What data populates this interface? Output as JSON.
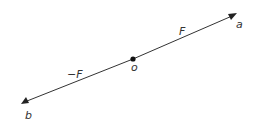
{
  "diagram": {
    "type": "force-vectors",
    "labels": {
      "force_positive": "F",
      "force_negative": "−F",
      "origin": "o",
      "end_a": "a",
      "end_b": "b"
    },
    "colors": {
      "line": "#333333",
      "text": "#333333"
    }
  }
}
